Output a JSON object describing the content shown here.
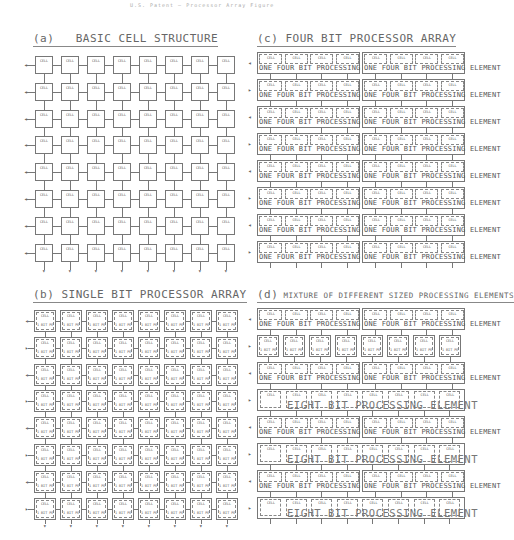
{
  "header": {
    "text": "U.S. Patent — Processor Array Figure"
  },
  "panels": {
    "a": {
      "label": "(a)",
      "title": "BASIC CELL STRUCTURE",
      "rows": 8,
      "cols": 8,
      "cell_text": "CELL"
    },
    "b": {
      "label": "(b)",
      "title": "SINGLE BIT PROCESSOR ARRAY",
      "rows": 8,
      "cols": 8,
      "cell_text": "CELL",
      "pe_text": "1 BIT PE"
    },
    "c": {
      "label": "(c)",
      "title": "FOUR BIT PROCESSOR ARRAY",
      "rows": 8,
      "pes_per_row": 2,
      "cells_per_pe": 4,
      "cell_text": "CELL",
      "pe_text": "ONE FOUR BIT PROCESSING ELEMENT"
    },
    "d": {
      "label": "(d)",
      "title": "MIXTURE OF DIFFERENT SIZED PROCESSING ELEMENTS",
      "cell_text": "CELL",
      "rows": [
        {
          "type": "four",
          "pe_text": "ONE FOUR BIT PROCESSING ELEMENT"
        },
        {
          "type": "single",
          "pe_text": "1 BIT PE"
        },
        {
          "type": "four",
          "pe_text": "ONE FOUR BIT PROCESSING ELEMENT"
        },
        {
          "type": "eight",
          "pe_text": "EIGHT BIT PROCESSING ELEMENT"
        },
        {
          "type": "four",
          "pe_text": "ONE FOUR BIT PROCESSING ELEMENT"
        },
        {
          "type": "eight",
          "pe_text": "EIGHT BIT PROCESSING ELEMENT"
        },
        {
          "type": "four",
          "pe_text": "ONE FOUR BIT PROCESSING ELEMENT"
        },
        {
          "type": "eight",
          "pe_text": "EIGHT BIT PROCESSING ELEMENT"
        }
      ]
    }
  }
}
